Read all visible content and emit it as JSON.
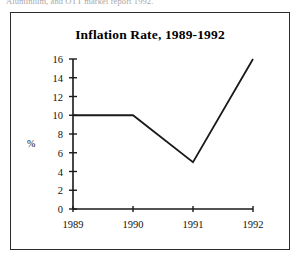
{
  "page": {
    "caption_fragment": "Aluminium, and OTT market report 1992."
  },
  "figure": {
    "title": "Inflation Rate, 1989-1992",
    "axis_unit_label": "%",
    "frame_color": "#2b2b2b",
    "line_color": "#1a1a1a",
    "background": "#ffffff"
  },
  "chart_data": {
    "type": "line",
    "title": "Inflation Rate, 1989-1992",
    "xlabel": "",
    "ylabel": "%",
    "categories": [
      "1989",
      "1990",
      "1991",
      "1992"
    ],
    "x": [
      1989,
      1990,
      1991,
      1992
    ],
    "values": [
      10,
      10,
      5,
      16
    ],
    "series": [
      {
        "name": "Inflation Rate",
        "values": [
          10,
          10,
          5,
          16
        ]
      }
    ],
    "ylim": [
      0,
      16
    ],
    "ytick_labels": [
      "0",
      "2",
      "4",
      "6",
      "8",
      "10",
      "12",
      "14",
      "16"
    ],
    "ytick_values": [
      0,
      2,
      4,
      6,
      8,
      10,
      12,
      14,
      16
    ],
    "xtick_labels": [
      "1989",
      "1990",
      "1991",
      "1992"
    ],
    "grid": false,
    "legend": false,
    "markers": false
  }
}
